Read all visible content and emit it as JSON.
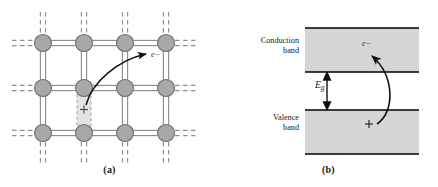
{
  "figure": {
    "width": 438,
    "height": 187,
    "background": "#ffffff"
  },
  "panels": [
    {
      "id": "a",
      "caption": "(a)",
      "description": "Covalent bond lattice with a broken bond leaving a hole and a freed electron",
      "electron_label": "e−",
      "hole_label": "+",
      "lattice": {
        "columns": 4,
        "rows": 3,
        "atom_xs": [
          43,
          84,
          125,
          166
        ],
        "atom_ys": [
          43,
          88,
          133
        ],
        "atom_radius": 8.5,
        "atom_fill": "#a8a8a8",
        "atom_stroke": "#6e6e6e",
        "bond_color": "#8f8f8f",
        "bond_style": "double-line",
        "edge_bond_style": "dashed"
      },
      "hole_box": {
        "x": 77,
        "y": 92,
        "width": 14,
        "height": 35,
        "fill": "#e2e2e2",
        "stroke": "#9a9a9a",
        "stroke_style": "dashed"
      }
    },
    {
      "id": "b",
      "caption": "(b)",
      "description": "Band diagram showing an electron excited across the band gap leaving a hole",
      "conduction_band_label": "Conduction\nband",
      "valence_band_label": "Valence\nband",
      "gap_symbol": "E",
      "gap_subscript": "g",
      "electron_label": "e−",
      "hole_label": "+",
      "bands": [
        {
          "name": "conduction-band",
          "top": 28,
          "bottom": 72,
          "left": 86,
          "right": 200
        },
        {
          "name": "valence-band",
          "top": 110,
          "bottom": 154,
          "left": 86,
          "right": 200
        }
      ],
      "band_fill": "#d6d6d6",
      "band_edge_color": "#000000",
      "gap_arrow": {
        "x": 108,
        "top": 74,
        "bottom": 108
      }
    }
  ],
  "colors": {
    "atom_fill": "#a8a8a8",
    "atom_stroke": "#6e6e6e",
    "bond": "#8f8f8f",
    "band_fill": "#d6d6d6",
    "band_edge": "#000000",
    "arrow": "#111111",
    "text": "#1a1a1a",
    "background": "#ffffff"
  }
}
